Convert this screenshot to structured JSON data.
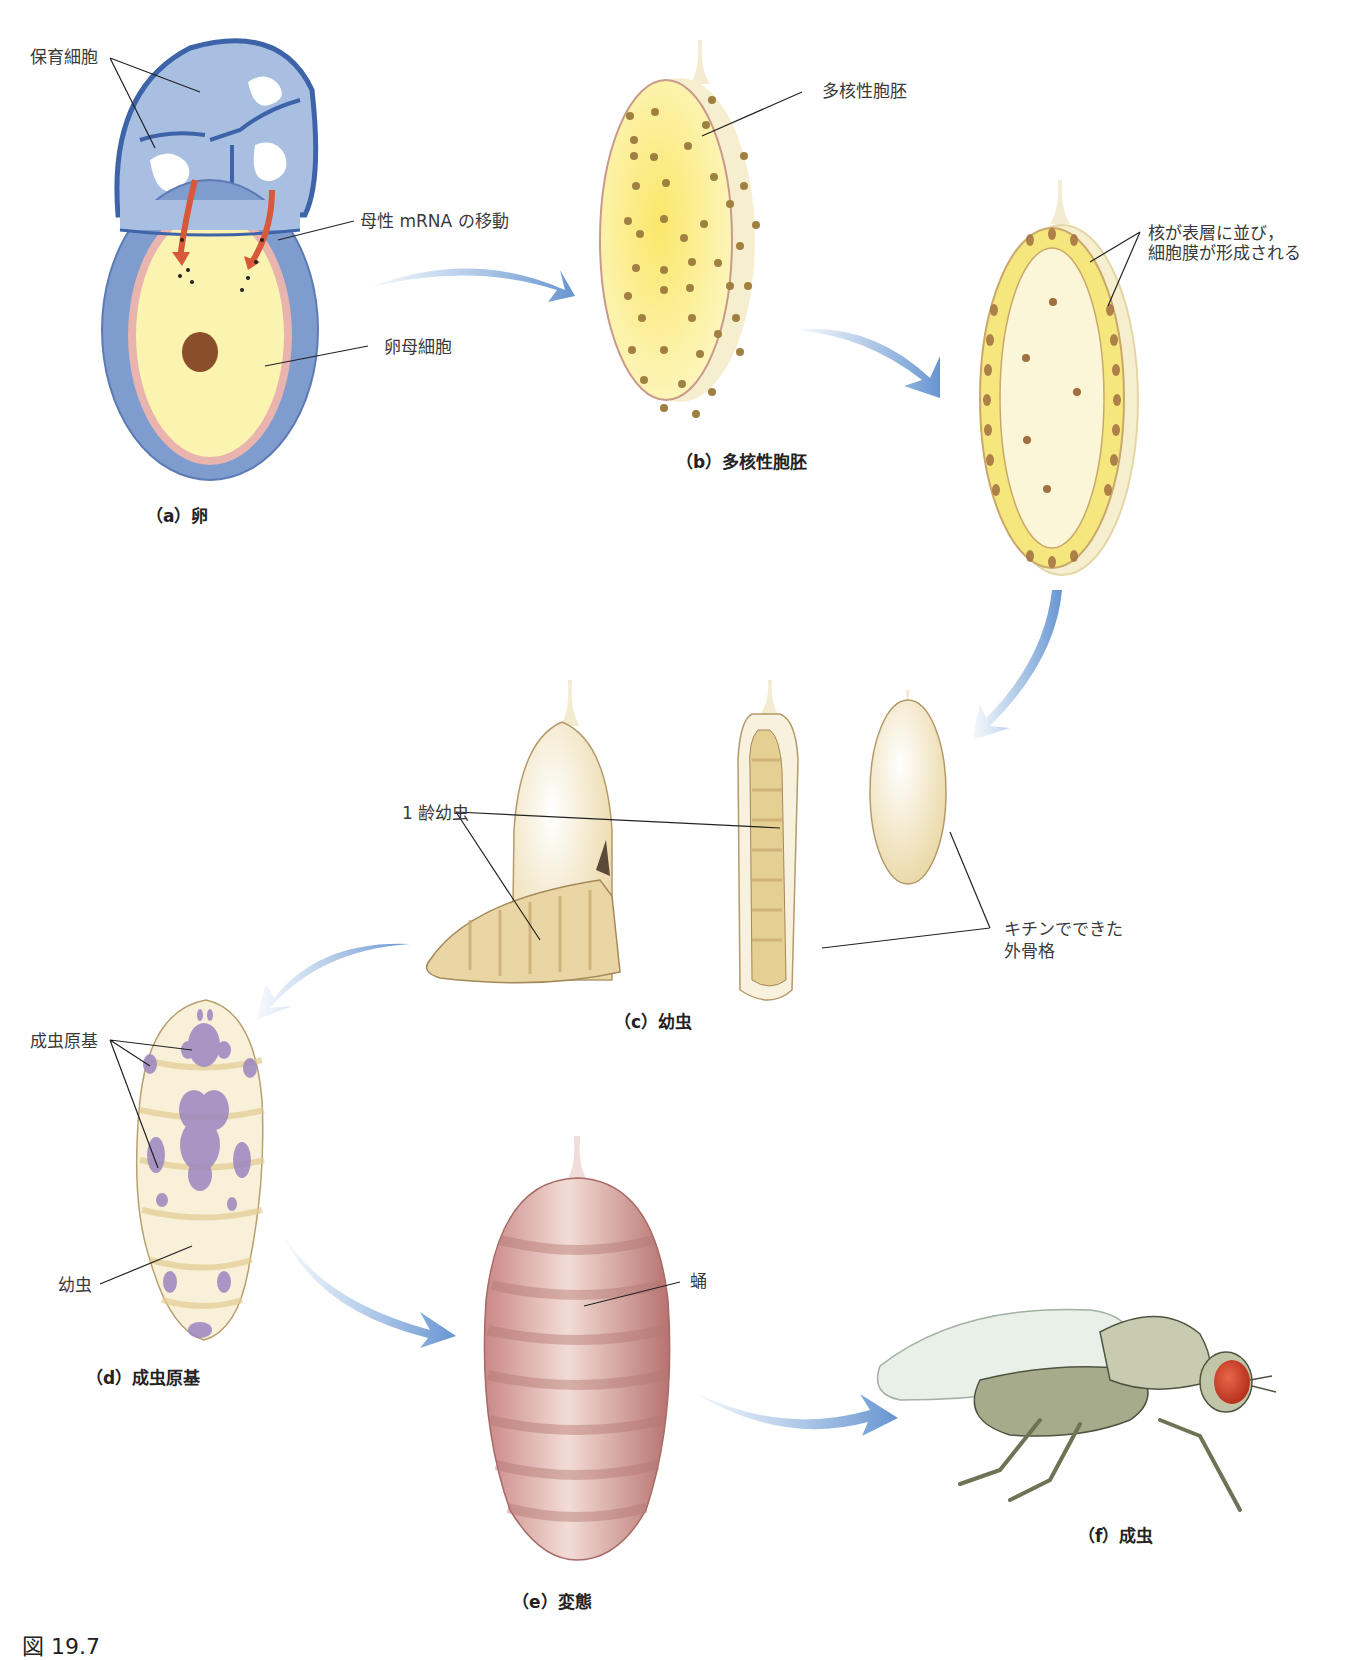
{
  "figure": {
    "number_label": "図 19.7",
    "stages": [
      {
        "id": "a",
        "caption": "（a）卵"
      },
      {
        "id": "b",
        "caption": "（b）多核性胞胚"
      },
      {
        "id": "c",
        "caption": "（c）幼虫"
      },
      {
        "id": "d",
        "caption": "（d）成虫原基"
      },
      {
        "id": "e",
        "caption": "（e）変態"
      },
      {
        "id": "f",
        "caption": "（f）成虫"
      }
    ]
  },
  "labels": {
    "nurse_cells": "保育細胞",
    "maternal_mrna": "母性 mRNA の移動",
    "oocyte": "卵母細胞",
    "syncytial_blastoderm": "多核性胞胚",
    "cellularization_line1": "核が表層に並び，",
    "cellularization_line2": "細胞膜が形成される",
    "first_instar_larva": "1 齢幼虫",
    "chitin_line1": "キチンでできた",
    "chitin_line2": "外骨格",
    "imaginal_discs": "成虫原基",
    "larva": "幼虫",
    "pupa": "蛹"
  },
  "colors": {
    "arrow_blue": "#6f9fd6",
    "nurse_blue": "#9fb7dd",
    "follicle_blue": "#7d9bcf",
    "yolk_yellow": "#fbf3b0",
    "nucleus_brown": "#8a5a2e",
    "larva_cream": "#f2e6c6",
    "disc_purple": "#9b86c0",
    "pupa_pink": "#d9a3a0",
    "fly_eye_red": "#d2452b",
    "fly_body": "#b9bea2"
  }
}
